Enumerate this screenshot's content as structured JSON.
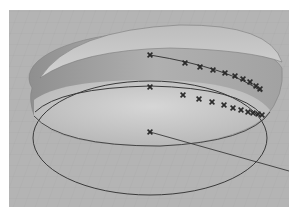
{
  "viewport": {
    "background_color": "#b4b4b4",
    "grid_color": "#a9a9a9",
    "curve_color": "#3a3a3a",
    "marker_color": "#2a2a2a"
  },
  "scene": {
    "disk": {
      "top_face_color": "#c9c9c9",
      "side_color": "#9a9a9a"
    },
    "control_points_upper": [
      [
        150,
        55
      ],
      [
        185,
        63
      ],
      [
        200,
        67
      ],
      [
        213,
        70
      ],
      [
        225,
        73
      ],
      [
        235,
        76
      ],
      [
        243,
        79
      ],
      [
        250,
        82
      ],
      [
        256,
        86
      ],
      [
        260,
        89
      ]
    ],
    "control_points_lower": [
      [
        150,
        87
      ],
      [
        183,
        95
      ],
      [
        199,
        99
      ],
      [
        212,
        102
      ],
      [
        224,
        105
      ],
      [
        233,
        108
      ],
      [
        241,
        110
      ],
      [
        248,
        112
      ],
      [
        253,
        113
      ],
      [
        258,
        114
      ],
      [
        262,
        115
      ]
    ],
    "center_point": [
      150,
      132
    ],
    "axis_line_end": [
      289,
      171
    ],
    "icons": {
      "control_point": "x-marker-icon"
    }
  }
}
